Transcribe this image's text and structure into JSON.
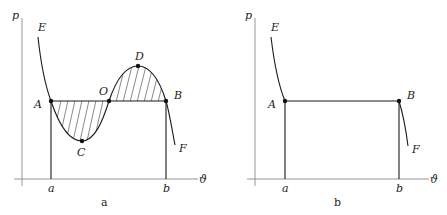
{
  "panels": [
    {
      "caption": "a",
      "axes": {
        "y_label": "p",
        "x_label": "ϑ"
      },
      "x_ticks": [
        "a",
        "b"
      ],
      "points": {
        "E": "E",
        "A": "A",
        "O": "O",
        "B": "B",
        "C": "C",
        "D": "D",
        "F": "F"
      },
      "description": "Van der Waals isotherm EACODBF with horizontal line AOB; shaded equal areas ACO and ODB (Maxwell construction)"
    },
    {
      "caption": "b",
      "axes": {
        "y_label": "p",
        "x_label": "ϑ"
      },
      "x_ticks": [
        "a",
        "b"
      ],
      "points": {
        "E": "E",
        "A": "A",
        "B": "B",
        "F": "F"
      },
      "description": "Real isotherm E-A-B-F with horizontal segment AB"
    }
  ],
  "colors": {
    "curve": "#1a1a1a",
    "axis": "#8a8a8a",
    "hatch": "#3a3a3a"
  }
}
